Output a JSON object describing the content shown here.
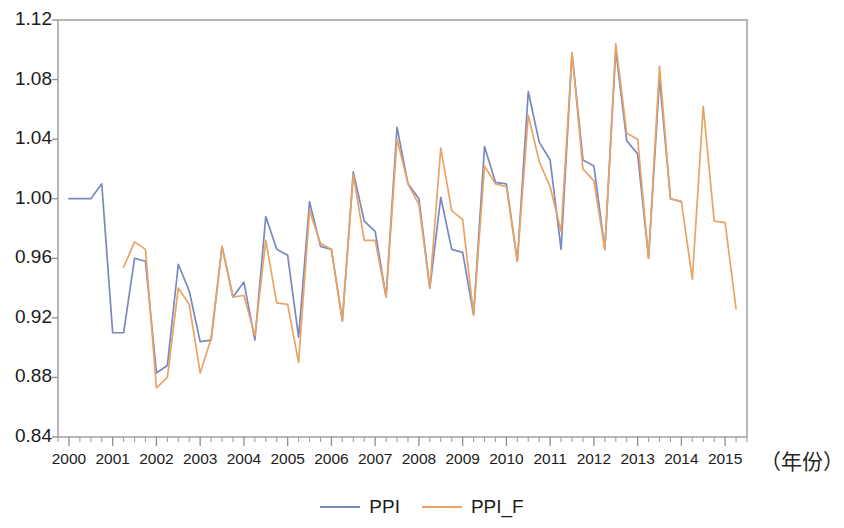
{
  "chart_data": {
    "type": "line",
    "title": "",
    "subtitle": "",
    "xlabel": "（年份）",
    "ylabel": "",
    "ylim": [
      0.84,
      1.12
    ],
    "ytick_values": [
      0.84,
      0.88,
      0.92,
      0.96,
      1.0,
      1.04,
      1.08,
      1.12
    ],
    "ytick_labels": [
      "0.84",
      "0.88",
      "0.92",
      "0.96",
      "1.00",
      "1.04",
      "1.08",
      "1.12"
    ],
    "xlim": [
      1999.75,
      2015.5
    ],
    "xtick_labels": [
      "2000",
      "2001",
      "2002",
      "2003",
      "2004",
      "2005",
      "2006",
      "2007",
      "2008",
      "2009",
      "2010",
      "2011",
      "2012",
      "2013",
      "2014",
      "2015"
    ],
    "xtick_values": [
      2000,
      2001,
      2002,
      2003,
      2004,
      2005,
      2006,
      2007,
      2008,
      2009,
      2010,
      2011,
      2012,
      2013,
      2014,
      2015
    ],
    "minor_ticks_per_interval": 4,
    "grid": false,
    "legend_position": "bottom",
    "frequency": "quarterly",
    "series": [
      {
        "name": "PPI",
        "color": "#7a88c0",
        "x": [
          2000.0,
          2000.25,
          2000.5,
          2000.75,
          2001.0,
          2001.25,
          2001.5,
          2001.75,
          2002.0,
          2002.25,
          2002.5,
          2002.75,
          2003.0,
          2003.25,
          2003.5,
          2003.75,
          2004.0,
          2004.25,
          2004.5,
          2004.75,
          2005.0,
          2005.25,
          2005.5,
          2005.75,
          2006.0,
          2006.25,
          2006.5,
          2006.75,
          2007.0,
          2007.25,
          2007.5,
          2007.75,
          2008.0,
          2008.25,
          2008.5,
          2008.75,
          2009.0,
          2009.25,
          2009.5,
          2009.75,
          2010.0,
          2010.25,
          2010.5,
          2010.75,
          2011.0,
          2011.25,
          2011.5,
          2011.75,
          2012.0,
          2012.25,
          2012.5,
          2012.75,
          2013.0,
          2013.25,
          2013.5,
          2013.75,
          2014.0
        ],
        "values": [
          1.0,
          1.0,
          1.0,
          1.01,
          0.91,
          0.91,
          0.96,
          0.958,
          0.883,
          0.888,
          0.956,
          0.938,
          0.904,
          0.905,
          0.968,
          0.934,
          0.944,
          0.905,
          0.988,
          0.966,
          0.962,
          0.907,
          0.998,
          0.968,
          0.966,
          0.918,
          1.018,
          0.985,
          0.978,
          0.934,
          1.048,
          1.01,
          1.0,
          0.94,
          1.001,
          0.966,
          0.964,
          0.922,
          1.035,
          1.011,
          1.01,
          0.958,
          1.072,
          1.038,
          1.026,
          0.966,
          1.098,
          1.026,
          1.022,
          0.966,
          1.1,
          1.039,
          1.03,
          0.96,
          1.081,
          1.0,
          0.998
        ]
      },
      {
        "name": "PPI_F",
        "color": "#e8a464",
        "x": [
          2001.25,
          2001.5,
          2001.75,
          2002.0,
          2002.25,
          2002.5,
          2002.75,
          2003.0,
          2003.25,
          2003.5,
          2003.75,
          2004.0,
          2004.25,
          2004.5,
          2004.75,
          2005.0,
          2005.25,
          2005.5,
          2005.75,
          2006.0,
          2006.25,
          2006.5,
          2006.75,
          2007.0,
          2007.25,
          2007.5,
          2007.75,
          2008.0,
          2008.25,
          2008.5,
          2008.75,
          2009.0,
          2009.25,
          2009.5,
          2009.75,
          2010.0,
          2010.25,
          2010.5,
          2010.75,
          2011.0,
          2011.25,
          2011.5,
          2011.75,
          2012.0,
          2012.25,
          2012.5,
          2012.75,
          2013.0,
          2013.25,
          2013.5,
          2013.75,
          2014.0,
          2014.25,
          2014.5,
          2014.75,
          2015.0,
          2015.25
        ],
        "values": [
          0.954,
          0.971,
          0.966,
          0.873,
          0.88,
          0.94,
          0.929,
          0.883,
          0.906,
          0.968,
          0.934,
          0.935,
          0.908,
          0.972,
          0.93,
          0.929,
          0.89,
          0.992,
          0.97,
          0.966,
          0.918,
          1.016,
          0.972,
          0.972,
          0.934,
          1.04,
          1.01,
          0.996,
          0.94,
          1.034,
          0.992,
          0.986,
          0.922,
          1.022,
          1.01,
          1.008,
          0.958,
          1.056,
          1.025,
          1.008,
          0.978,
          1.098,
          1.02,
          1.012,
          0.966,
          1.104,
          1.044,
          1.04,
          0.96,
          1.089,
          1.0,
          0.998,
          0.946,
          1.062,
          0.985,
          0.984,
          0.926
        ]
      }
    ]
  },
  "legend": {
    "items": [
      {
        "label": "PPI",
        "color": "#7a88c0"
      },
      {
        "label": "PPI_F",
        "color": "#e8a464"
      }
    ]
  }
}
